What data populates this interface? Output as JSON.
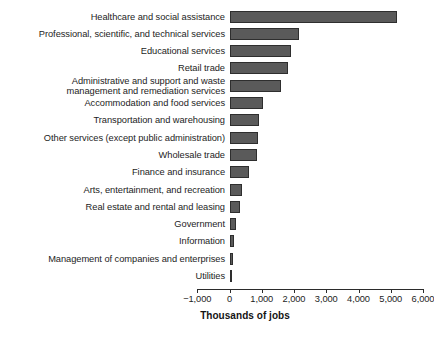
{
  "chart_data": {
    "type": "bar",
    "orientation": "horizontal",
    "title": "",
    "xlabel": "Thousands of jobs",
    "ylabel": "",
    "xlim": [
      -1000,
      6000
    ],
    "grid": false,
    "legend": null,
    "bar_color": "#5a5a5a",
    "bar_edge_color": "#2e2e2e",
    "xticks": [
      -1000,
      0,
      1000,
      2000,
      3000,
      4000,
      5000,
      6000
    ],
    "xticklabels": [
      "−1,000",
      "0",
      "1,000",
      "2,000",
      "3,000",
      "4,000",
      "5,000",
      "6,000"
    ],
    "categories": [
      "Healthcare and social assistance",
      "Professional, scientific, and technical services",
      "Educational services",
      "Retail trade",
      "Administrative and support and waste\nmanagement and remediation services",
      "Accommodation and food services",
      "Transportation and warehousing",
      "Other services (except public administration)",
      "Wholesale trade",
      "Finance and insurance",
      "Arts, entertainment, and recreation",
      "Real estate and rental and leasing",
      "Government",
      "Information",
      "Management of companies and enterprises",
      "Utilities"
    ],
    "values": [
      5200,
      2150,
      1900,
      1800,
      1600,
      1050,
      900,
      880,
      850,
      600,
      390,
      330,
      200,
      140,
      110,
      20
    ]
  },
  "axis": {
    "title": "Thousands of jobs"
  }
}
